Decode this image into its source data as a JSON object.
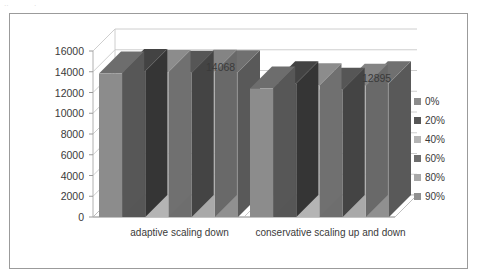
{
  "frame": {
    "border_color": "#9b9b9b",
    "background": "#ffffff"
  },
  "artifacts": [
    {
      "text": "··",
      "x": 4,
      "y": 2
    },
    {
      "text": "·",
      "x": 34,
      "y": 2
    }
  ],
  "chart_data": {
    "type": "bar",
    "title": "",
    "subtitle": "",
    "xlabel": "",
    "ylabel": "",
    "categories": [
      "adaptive scaling down",
      "conservative scaling up and down"
    ],
    "series": [
      {
        "name": "0%",
        "color": "#8c8c8c",
        "values": [
          13820,
          12380
        ]
      },
      {
        "name": "20%",
        "color": "#565656",
        "values": [
          14068,
          12895
        ]
      },
      {
        "name": "40%",
        "color": "#b4b4b4",
        "values": [
          13980,
          12700
        ]
      },
      {
        "name": "60%",
        "color": "#6e6e6e",
        "values": [
          13900,
          12260
        ]
      },
      {
        "name": "80%",
        "color": "#a9a9a9",
        "values": [
          14010,
          12640
        ]
      },
      {
        "name": "90%",
        "color": "#909090",
        "values": [
          13960,
          12880
        ]
      }
    ],
    "ylim": [
      0,
      16000
    ],
    "yticks": [
      0,
      2000,
      4000,
      6000,
      8000,
      10000,
      12000,
      14000,
      16000
    ],
    "ytick_labels": [
      "0",
      "2000",
      "4000",
      "6000",
      "8000",
      "10000",
      "12000",
      "14000",
      "16000"
    ],
    "grid": true,
    "grid_color": "#c8c8c8",
    "legend_position": "right",
    "three_d": true,
    "annotations": [
      {
        "text": "14068",
        "x": 196,
        "y": 48,
        "series": "20%",
        "category": "adaptive scaling down"
      },
      {
        "text": "12895",
        "x": 352,
        "y": 59,
        "series": "20%",
        "category": "conservative scaling up and down"
      }
    ]
  },
  "legend": {
    "items": [
      {
        "label": "0%",
        "color": "#8c8c8c"
      },
      {
        "label": "20%",
        "color": "#565656"
      },
      {
        "label": "40%",
        "color": "#b4b4b4"
      },
      {
        "label": "60%",
        "color": "#6e6e6e"
      },
      {
        "label": "80%",
        "color": "#a9a9a9"
      },
      {
        "label": "90%",
        "color": "#909090"
      }
    ]
  }
}
